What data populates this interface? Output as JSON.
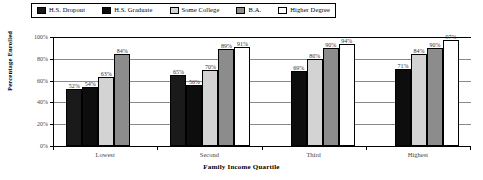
{
  "chart_data": {
    "type": "bar",
    "title": "",
    "xlabel": "Family Income Quartile",
    "ylabel": "Percentage Enrolled",
    "categories": [
      "Lowest",
      "Second",
      "Third",
      "Highest"
    ],
    "ylim": [
      0,
      100
    ],
    "yticks": [
      "0%",
      "20%",
      "40%",
      "60%",
      "80%",
      "100%"
    ],
    "ytick_values": [
      0,
      20,
      40,
      60,
      80,
      100
    ],
    "grid": true,
    "legend_position": "top",
    "series": [
      {
        "name": "H.S. Dropout",
        "color": "#1a1a1a",
        "values": [
          52,
          65,
          null,
          null
        ],
        "labels": [
          "52%",
          "65%",
          "",
          ""
        ]
      },
      {
        "name": "H.S. Graduate",
        "color": "#0d0d0d",
        "values": [
          54,
          56,
          69,
          71
        ],
        "labels": [
          "54%",
          "56%",
          "69%",
          "71%"
        ]
      },
      {
        "name": "Some College",
        "color": "#d3d3d3",
        "values": [
          63,
          70,
          80,
          84
        ],
        "labels": [
          "63%",
          "70%",
          "80%",
          "84%"
        ]
      },
      {
        "name": "B.A.",
        "color": "#8c8c8c",
        "values": [
          84,
          89,
          90,
          90
        ],
        "labels": [
          "84%",
          "89%",
          "90%",
          "90%"
        ]
      },
      {
        "name": "Higher Degree",
        "color": "#ffffff",
        "values": [
          null,
          91,
          94,
          97
        ],
        "labels": [
          "",
          "91%",
          "94%",
          "97%"
        ]
      }
    ]
  }
}
